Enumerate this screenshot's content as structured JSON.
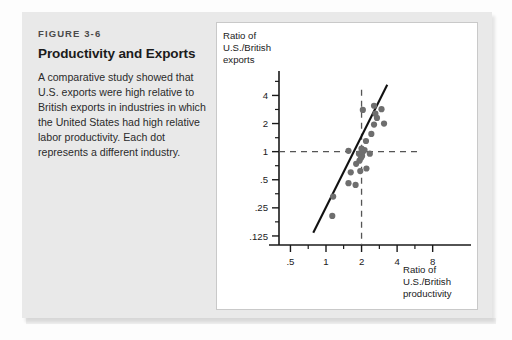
{
  "figure": {
    "number": "FIGURE 3-6",
    "title": "Productivity and Exports",
    "caption": "A comparative study showed that U.S. exports were high relative to British exports in industries in which the United States had high relative labor productivity. Each dot represents a different industry."
  },
  "colors": {
    "card_background": "#e9e9e9",
    "panel_background": "#ffffff",
    "panel_border": "#c9c9c9",
    "axis": "#1a1a1a",
    "dot": "#6e6e6e",
    "trend_line": "#111111",
    "reference_line": "#555555",
    "title_text": "#1b1b1b",
    "caption_text": "#2b2b2b"
  },
  "chart_data": {
    "type": "scatter",
    "title": "",
    "xlabel": "Ratio of U.S./British productivity",
    "ylabel": "Ratio of U.S./British exports",
    "xscale": "log",
    "yscale": "log",
    "xlim": [
      0.4,
      11
    ],
    "ylim": [
      0.1,
      6
    ],
    "xticks": [
      0.5,
      1,
      2,
      4,
      8
    ],
    "xticklabels": [
      ".5",
      "1",
      "2",
      "4",
      "8"
    ],
    "yticks": [
      4,
      2,
      1,
      0.5,
      0.25,
      0.125
    ],
    "yticklabels": [
      "4",
      "2",
      "1",
      ".5",
      ".25",
      ".125"
    ],
    "grid": false,
    "legend": null,
    "reference_lines": [
      {
        "orientation": "horizontal",
        "value": 1,
        "style": "dashed"
      },
      {
        "orientation": "vertical",
        "value": 2,
        "style": "dashed"
      }
    ],
    "trend_line": {
      "style": "solid",
      "x": [
        0.78,
        3.3
      ],
      "y": [
        0.135,
        5.2
      ]
    },
    "points": [
      {
        "x": 1.13,
        "y": 0.205
      },
      {
        "x": 1.15,
        "y": 0.33
      },
      {
        "x": 1.55,
        "y": 0.46
      },
      {
        "x": 1.78,
        "y": 0.44
      },
      {
        "x": 1.62,
        "y": 0.6
      },
      {
        "x": 1.95,
        "y": 0.62
      },
      {
        "x": 2.2,
        "y": 0.66
      },
      {
        "x": 1.8,
        "y": 0.74
      },
      {
        "x": 1.92,
        "y": 0.8
      },
      {
        "x": 1.98,
        "y": 0.86
      },
      {
        "x": 2.02,
        "y": 0.9
      },
      {
        "x": 1.9,
        "y": 0.95
      },
      {
        "x": 2.05,
        "y": 1.0
      },
      {
        "x": 2.12,
        "y": 1.04
      },
      {
        "x": 2.0,
        "y": 1.08
      },
      {
        "x": 2.35,
        "y": 0.95
      },
      {
        "x": 1.55,
        "y": 1.02
      },
      {
        "x": 2.18,
        "y": 1.3
      },
      {
        "x": 2.42,
        "y": 1.55
      },
      {
        "x": 2.55,
        "y": 1.95
      },
      {
        "x": 3.1,
        "y": 2.0
      },
      {
        "x": 2.7,
        "y": 2.3
      },
      {
        "x": 2.62,
        "y": 2.55
      },
      {
        "x": 2.95,
        "y": 2.85
      },
      {
        "x": 2.05,
        "y": 2.8
      },
      {
        "x": 2.55,
        "y": 3.1
      }
    ]
  }
}
